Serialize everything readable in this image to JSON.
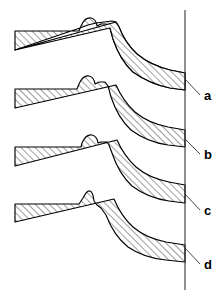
{
  "figure": {
    "background_color": "#ffffff",
    "line_color": "#000000",
    "datum_color": "#333333",
    "hatch_color": "#1a1a1a",
    "hatch_angle_degrees": 45,
    "width": 222,
    "height": 296
  },
  "datum": {
    "name": "vertical-reference-line",
    "x": 185,
    "y_top": 10,
    "y_bottom": 290
  },
  "labels": [
    {
      "id": "a",
      "text": "a",
      "x": 205,
      "y": 97,
      "leader_from_x": 185,
      "leader_from_y": 79,
      "leader_to_x": 200,
      "leader_to_y": 95
    },
    {
      "id": "b",
      "text": "b",
      "x": 205,
      "y": 156,
      "leader_from_x": 185,
      "leader_from_y": 139,
      "leader_to_x": 200,
      "leader_to_y": 154
    },
    {
      "id": "c",
      "text": "c",
      "x": 205,
      "y": 212,
      "leader_from_x": 185,
      "leader_from_y": 194,
      "leader_to_x": 200,
      "leader_to_y": 210
    },
    {
      "id": "d",
      "text": "d",
      "x": 205,
      "y": 266,
      "leader_from_x": 185,
      "leader_from_y": 248,
      "leader_to_x": 200,
      "leader_to_y": 264
    }
  ],
  "bands": [
    {
      "id": "band-a",
      "label": "a",
      "bump_style": "broad-rounded-with-shoulder",
      "path": "M 15 31 L 78 31 L 80 27 Q 84 18 90 19 Q 95 20 96 27 L 100 25 L 104 25 L 108 28 L 112 38 Q 119 58 132 70 Q 148 81 168 85 L 185 87 L 185 71 L 170 68 Q 150 63 136 52 Q 124 42 118 27 L 116 23 L 15 50 Z"
    },
    {
      "id": "band-a-lower",
      "label": "a",
      "bump_style": "none",
      "path": "M 15 31 L 78 31 L 80 27 Q 84 18 90 19 Q 95 20 96 27 L 100 25 L 104 25 L 108 28 L 112 38 Q 119 58 132 70 Q 148 81 168 85 L 185 87 L 185 71 L 168 68 Q 148 63 134 51 Q 121 39 114 22 L 15 50 Z"
    },
    {
      "id": "band-b",
      "label": "b",
      "bump_style": "rounded-with-step",
      "path": "M 15 89 L 76 89 L 78 85 Q 82 76 88 77 Q 93 78 94 85 L 98 83 L 104 83 L 106 87 L 109 96 Q 115 116 128 128 Q 144 140 166 143 L 185 145 L 185 129 L 166 126 Q 146 122 133 111 Q 121 100 114 84 L 15 108 Z"
    },
    {
      "id": "band-c",
      "label": "c",
      "bump_style": "semicircular-dome",
      "path": "M 15 147 L 80 147 L 81 144 Q 85 135 91 136 Q 96 137 97 144 L 100 143 L 106 143 L 108 146 L 110 152 Q 116 172 129 184 Q 145 196 166 199 L 185 201 L 185 183 L 166 180 Q 146 176 133 165 Q 121 154 114 138 L 15 166 Z"
    },
    {
      "id": "band-d",
      "label": "d",
      "bump_style": "sharp-peak",
      "path": "M 15 204 L 78 204 L 82 199 Q 86 191 89 192 Q 92 193 93 201 L 96 204 L 100 206 L 104 212 Q 112 234 126 245 Q 142 256 164 258 L 185 260 L 185 243 L 164 240 Q 144 236 131 225 Q 119 214 112 198 L 15 222 Z"
    }
  ],
  "band_paths": {
    "a_upper": "M 15 31 L 79 31 L 81 26 Q 85 17 91 18 Q 96 19 97 26 L 101 24 L 106 24 L 110 28 L 113 39 Q 120 60 133 72 Q 150 84 170 88 L 185 90 L 185 73 L 170 70 Q 150 65 137 54 Q 125 43 119 27 L 116 22 L 112 21 L 96 23 L 88 25 L 80 28 L 15 50 Z",
    "b_upper": "M 15 89 L 77 89 L 79 84 Q 83 75 89 76 Q 94 77 95 84 L 99 82 L 105 82 L 108 86 L 111 97 Q 118 118 131 130 Q 147 142 168 145 L 185 147 L 185 130 L 168 127 Q 148 123 135 112 Q 123 101 116 85 L 15 108 Z",
    "c_upper": "M 15 147 L 81 147 L 82 143 Q 86 134 92 135 Q 97 136 98 143 L 101 142 L 107 142 L 109 145 L 112 153 Q 119 174 132 186 Q 148 198 169 201 L 185 203 L 185 185 L 169 182 Q 149 178 136 167 Q 124 156 117 140 L 15 166 Z",
    "d_upper": "M 15 204 L 79 204 L 83 198 Q 87 190 90 191 Q 93 192 94 201 L 97 205 L 101 208 L 106 215 Q 114 236 128 247 Q 144 258 166 260 L 185 262 L 185 245 L 166 242 Q 146 238 133 227 Q 121 216 114 199 L 15 222 Z"
  },
  "lower_band_paths": {
    "a_lower": "M 15 50 L 116 22 L 119 27 Q 125 43 137 54 Q 150 65 170 70 L 185 73 L 185 90 L 170 88 Q 150 84 133 72 Q 120 60 113 39 L 110 28 L 15 50 Z"
  }
}
